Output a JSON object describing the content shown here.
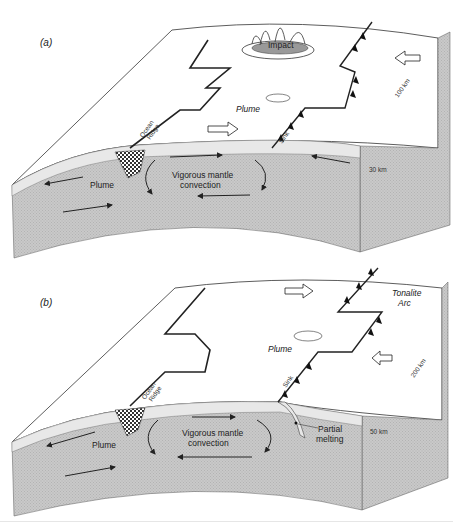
{
  "figure": {
    "panels": [
      {
        "id": "a",
        "label": "(a)",
        "labels": {
          "impact": "Impact",
          "plume_surface": "Plume",
          "ocean_ridge_line1": "Ocean",
          "ocean_ridge_line2": "Ridge",
          "sink": "Sink",
          "convection_line1": "Vigorous mantle",
          "convection_line2": "convection",
          "plume_mantle": "Plume",
          "scale_horizontal": "100 km",
          "scale_vertical": "30 km"
        }
      },
      {
        "id": "b",
        "label": "(b)",
        "labels": {
          "tonalite_line1": "Tonalite",
          "tonalite_line2": "Arc",
          "plume_surface": "Plume",
          "ocean_ridge_line1": "Ocean",
          "ocean_ridge_line2": "Ridge",
          "sink": "Sink",
          "convection_line1": "Vigorous mantle",
          "convection_line2": "convection",
          "plume_mantle": "Plume",
          "partial_line1": "Partial",
          "partial_line2": "melting",
          "scale_horizontal": "200 km",
          "scale_vertical": "50 km"
        }
      }
    ],
    "colors": {
      "surface": "#ffffff",
      "mantle": "#c8c8c8",
      "mantle_side": "#bdbdbd",
      "crust": "#e6e6e6",
      "line": "#222222",
      "plume_hatch": "#444444"
    }
  }
}
